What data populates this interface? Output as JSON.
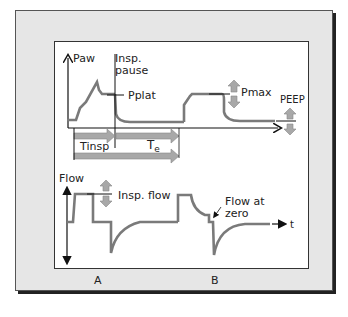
{
  "colors": {
    "frame_bg": "#e6e6e6",
    "panel_bg": "#ffffff",
    "curve": "#7a7a7a",
    "arrow_fill": "#a8a8a8",
    "axis": "#111111"
  },
  "pressure_panel": {
    "y_axis_label": "Paw",
    "insp_pause_label_line1": "Insp.",
    "insp_pause_label_line2": "pause",
    "pplat_label": "Pplat",
    "pmax_label": "Pmax",
    "peep_label": "PEEP",
    "tinsp_label": "Tinsp",
    "te_label_main": "T",
    "te_label_sub": "e"
  },
  "flow_panel": {
    "y_axis_label": "Flow",
    "insp_flow_label": "Insp. flow",
    "flow_at_zero_line1": "Flow at",
    "flow_at_zero_line2": "zero",
    "x_axis_label": "t"
  },
  "panel_labels": {
    "a": "A",
    "b": "B"
  },
  "icons": [
    "up-down-adjust-arrow-icon",
    "time-span-arrow-icon",
    "axis-arrow-icon"
  ]
}
